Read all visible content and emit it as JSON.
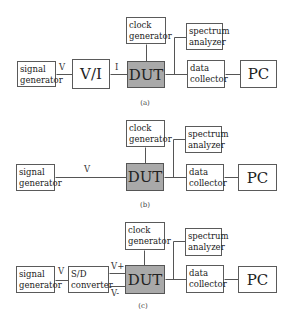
{
  "panels": [
    {
      "id": "a",
      "caption": "(a)",
      "caption_pos": [
        145,
        99
      ],
      "boxes": [
        {
          "key": "signal_generator",
          "line1": "signal",
          "line2": "generator",
          "x": 17,
          "y": 61,
          "w": 39,
          "h": 26,
          "style": "small"
        },
        {
          "key": "vi_converter",
          "line1": "V/I",
          "line2": "",
          "x": 72,
          "y": 59,
          "w": 38,
          "h": 30,
          "style": "large"
        },
        {
          "key": "clock_generator",
          "line1": "clock",
          "line2": "generator",
          "x": 126,
          "y": 17,
          "w": 40,
          "h": 27,
          "style": "small"
        },
        {
          "key": "dut",
          "line1": "DUT",
          "line2": "",
          "x": 127,
          "y": 61,
          "w": 38,
          "h": 27,
          "style": "dut"
        },
        {
          "key": "spectrum_analyzer",
          "line1": "spectrum",
          "line2": "analyzer",
          "x": 186,
          "y": 23,
          "w": 37,
          "h": 27,
          "style": "small"
        },
        {
          "key": "data_collector",
          "line1": "data",
          "line2": "collector",
          "x": 187,
          "y": 60,
          "w": 38,
          "h": 28,
          "style": "small"
        },
        {
          "key": "pc",
          "line1": "PC",
          "line2": "",
          "x": 240,
          "y": 60,
          "w": 37,
          "h": 28,
          "style": "large"
        }
      ],
      "lines": [
        [
          56,
          74,
          72,
          74
        ],
        [
          110,
          74,
          127,
          74
        ],
        [
          146,
          44,
          146,
          61
        ],
        [
          165,
          74,
          187,
          74
        ],
        [
          174,
          74,
          174,
          37
        ],
        [
          174,
          37,
          186,
          37
        ],
        [
          225,
          74,
          240,
          74
        ]
      ],
      "labels": [
        {
          "text": "V",
          "x": 59,
          "y": 62
        },
        {
          "text": "I",
          "x": 115,
          "y": 62
        }
      ]
    },
    {
      "id": "b",
      "caption": "(b)",
      "caption_pos": [
        145,
        201
      ],
      "boxes": [
        {
          "key": "signal_generator",
          "line1": "signal",
          "line2": "generator",
          "x": 16,
          "y": 164,
          "w": 39,
          "h": 27,
          "style": "small"
        },
        {
          "key": "clock_generator",
          "line1": "clock",
          "line2": "generator",
          "x": 126,
          "y": 120,
          "w": 39,
          "h": 27,
          "style": "small"
        },
        {
          "key": "dut",
          "line1": "DUT",
          "line2": "",
          "x": 126,
          "y": 163,
          "w": 38,
          "h": 28,
          "style": "dut"
        },
        {
          "key": "spectrum_analyzer",
          "line1": "spectrum",
          "line2": "analyzer",
          "x": 185,
          "y": 126,
          "w": 37,
          "h": 27,
          "style": "small"
        },
        {
          "key": "data_collector",
          "line1": "data",
          "line2": "collector",
          "x": 186,
          "y": 164,
          "w": 38,
          "h": 27,
          "style": "small"
        },
        {
          "key": "pc",
          "line1": "PC",
          "line2": "",
          "x": 238,
          "y": 164,
          "w": 39,
          "h": 27,
          "style": "large"
        }
      ],
      "lines": [
        [
          55,
          177,
          126,
          177
        ],
        [
          145,
          147,
          145,
          163
        ],
        [
          164,
          177,
          186,
          177
        ],
        [
          173,
          177,
          173,
          139
        ],
        [
          173,
          139,
          185,
          139
        ],
        [
          224,
          177,
          238,
          177
        ]
      ],
      "labels": [
        {
          "text": "V",
          "x": 84,
          "y": 164
        }
      ]
    },
    {
      "id": "c",
      "caption": "(c)",
      "caption_pos": [
        143,
        302
      ],
      "boxes": [
        {
          "key": "signal_generator",
          "line1": "signal",
          "line2": "generator",
          "x": 16,
          "y": 266,
          "w": 39,
          "h": 27,
          "style": "small"
        },
        {
          "key": "sd_converter",
          "line1": "S/D",
          "line2": "converter",
          "x": 68,
          "y": 266,
          "w": 41,
          "h": 27,
          "style": "small"
        },
        {
          "key": "clock_generator",
          "line1": "clock",
          "line2": "generator",
          "x": 125,
          "y": 222,
          "w": 40,
          "h": 28,
          "style": "small"
        },
        {
          "key": "dut",
          "line1": "DUT",
          "line2": "",
          "x": 125,
          "y": 265,
          "w": 40,
          "h": 29,
          "style": "dut"
        },
        {
          "key": "spectrum_analyzer",
          "line1": "spectrum",
          "line2": "analyzer",
          "x": 185,
          "y": 228,
          "w": 37,
          "h": 28,
          "style": "small"
        },
        {
          "key": "data_collector",
          "line1": "data",
          "line2": "collector",
          "x": 186,
          "y": 265,
          "w": 38,
          "h": 28,
          "style": "small"
        },
        {
          "key": "pc",
          "line1": "PC",
          "line2": "",
          "x": 238,
          "y": 266,
          "w": 39,
          "h": 27,
          "style": "large"
        }
      ],
      "lines": [
        [
          55,
          280,
          68,
          280
        ],
        [
          109,
          273,
          125,
          273
        ],
        [
          109,
          286,
          125,
          286
        ],
        [
          144,
          250,
          144,
          265
        ],
        [
          165,
          279,
          186,
          279
        ],
        [
          173,
          279,
          173,
          241
        ],
        [
          173,
          241,
          185,
          241
        ],
        [
          224,
          279,
          238,
          279
        ]
      ],
      "labels": [
        {
          "text": "V",
          "x": 58,
          "y": 266
        },
        {
          "text": "V+",
          "x": 111,
          "y": 261
        },
        {
          "text": "V-",
          "x": 111,
          "y": 288
        }
      ]
    }
  ]
}
